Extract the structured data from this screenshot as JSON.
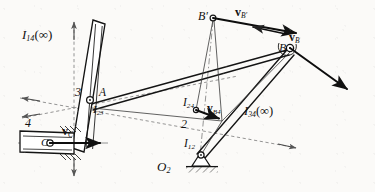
{
  "figure": {
    "type": "kinematic-linkage-diagram",
    "background_color": "#fbfaf8",
    "line_color": "#1a1a1a",
    "dashed_color": "#6d6d6d",
    "width": 375,
    "height": 192
  },
  "labels": {
    "i14": {
      "base": "I",
      "sub": "14",
      "suffix": "(∞)",
      "x": 22,
      "y": 28
    },
    "i23": {
      "base": "I",
      "sub": "23",
      "suffix": "",
      "x": 93,
      "y": 104
    },
    "i24": {
      "base": "I",
      "sub": "24",
      "suffix": "",
      "x": 185,
      "y": 98
    },
    "i34": {
      "base": "I",
      "sub": "34",
      "suffix": "(∞)",
      "x": 245,
      "y": 104
    },
    "i12": {
      "base": "I",
      "sub": "12",
      "suffix": "",
      "x": 185,
      "y": 140
    },
    "o2": {
      "base": "O",
      "sub": "2",
      "suffix": "",
      "x": 158,
      "y": 163
    },
    "link2": {
      "text": "2",
      "x": 182,
      "y": 120
    },
    "link3": {
      "text": "3",
      "x": 76,
      "y": 88
    },
    "link4": {
      "text": "4",
      "x": 26,
      "y": 118
    },
    "point_a": {
      "text": "A",
      "x": 99,
      "y": 88
    },
    "point_b": {
      "text": "B",
      "x": 281,
      "y": 40
    },
    "point_bprime": {
      "text": "B′",
      "x": 200,
      "y": 11
    },
    "point_c": {
      "text": "C",
      "x": 42,
      "y": 138
    },
    "v_c": {
      "base": "v",
      "sub": "C",
      "x": 62,
      "y": 127
    },
    "v_b": {
      "base": "v",
      "sub": "B",
      "x": 290,
      "y": 33
    },
    "v_bprime": {
      "base": "v",
      "sub": "B′",
      "x": 236,
      "y": 8
    },
    "v_b4": {
      "base": "v",
      "sub": "B4",
      "x": 209,
      "y": 105
    }
  },
  "points": {
    "A": {
      "x": 90,
      "y": 100
    },
    "B": {
      "x": 290,
      "y": 48
    },
    "Bprime": {
      "x": 213,
      "y": 18
    },
    "C": {
      "x": 50,
      "y": 143
    },
    "O2": {
      "x": 201,
      "y": 157
    },
    "I24": {
      "x": 196,
      "y": 110
    },
    "I34": {
      "x": 222,
      "y": 120
    },
    "I14_arrow_tip": {
      "x": 74,
      "y": 22
    }
  },
  "vectors": [
    {
      "name": "v_C",
      "from_x": 50,
      "from_y": 143,
      "to_x": 106,
      "to_y": 143
    },
    {
      "name": "v_B4",
      "from_x": 196,
      "from_y": 110,
      "to_x": 224,
      "to_y": 120
    },
    {
      "name": "v_B",
      "from_x": 290,
      "from_y": 48,
      "to_x": 352,
      "to_y": 93
    },
    {
      "name": "v_Bprime",
      "from_x": 213,
      "from_y": 18,
      "to_x": 300,
      "to_y": 34
    },
    {
      "name": "v_Bprime_component",
      "from_x": 284,
      "from_y": 33,
      "to_x": 250,
      "to_y": 26
    }
  ],
  "axes": [
    {
      "name": "I14_vertical_dashed",
      "x1": 74,
      "y1": 22,
      "x2": 74,
      "y2": 176
    },
    {
      "name": "I34_dashed",
      "x1": 22,
      "y1": 99,
      "x2": 296,
      "y2": 148
    },
    {
      "name": "I24_dashed",
      "x1": 22,
      "y1": 117,
      "x2": 236,
      "y2": 78
    },
    {
      "name": "Bprime_dashed",
      "x1": 213,
      "y1": 18,
      "x2": 201,
      "y2": 157
    }
  ],
  "ground": {
    "name": "ground-hatching",
    "x": 201,
    "y": 163,
    "width": 34
  }
}
